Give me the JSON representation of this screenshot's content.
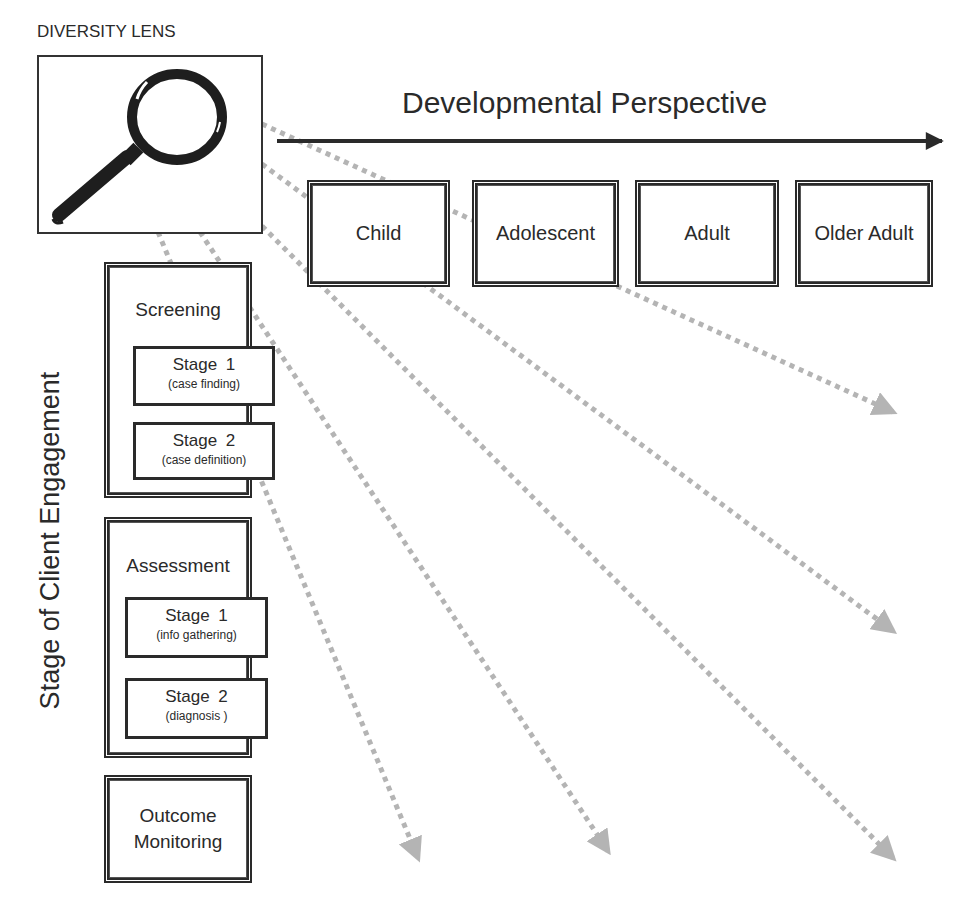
{
  "diversity_lens": {
    "title": "DIVERSITY LENS",
    "icon": "magnifying-glass-icon"
  },
  "developmental_perspective": {
    "title": "Developmental Perspective",
    "stages": [
      {
        "label": "Child"
      },
      {
        "label": "Adolescent"
      },
      {
        "label": "Adult"
      },
      {
        "label": "Older Adult"
      }
    ]
  },
  "client_engagement": {
    "axis_label": "Stage of Client Engagement",
    "screening": {
      "label": "Screening",
      "stages": [
        {
          "title": "Stage 1",
          "subtitle": "(case finding)"
        },
        {
          "title": "Stage 2",
          "subtitle": "(case definition)"
        }
      ]
    },
    "assessment": {
      "label": "Assessment",
      "stages": [
        {
          "title": "Stage 1",
          "subtitle": "(info gathering)"
        },
        {
          "title": "Stage 2",
          "subtitle": "(diagnosis )"
        }
      ]
    },
    "outcome": {
      "line1": "Outcome",
      "line2": "Monitoring"
    }
  },
  "colors": {
    "line": "#2a2a2a",
    "dotted_arrow": "#b4b4b4",
    "background": "#ffffff"
  }
}
